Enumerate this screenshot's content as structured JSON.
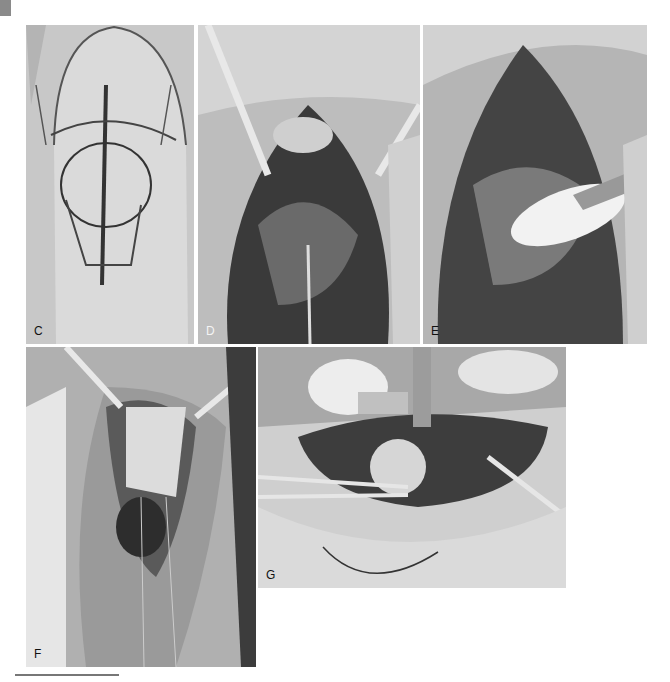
{
  "figure": {
    "corner_tab_color": "#8a8a8a",
    "panels": [
      {
        "id": "C",
        "label": "C",
        "description": "Knee skin marked with surgical incision lines (grayscale photo)"
      },
      {
        "id": "D",
        "label": "D",
        "description": "Open knee incision with retractors exposing joint"
      },
      {
        "id": "E",
        "label": "E",
        "description": "Exposed joint with white bone fragment and retractor"
      },
      {
        "id": "F",
        "label": "F",
        "description": "Vertical knee incision with sutures and retractors"
      },
      {
        "id": "G",
        "label": "G",
        "description": "Side view of knee surgery with drill guide and forceps"
      }
    ],
    "scale_bar": true
  }
}
